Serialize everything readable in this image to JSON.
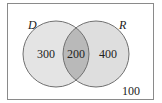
{
  "diagram": {
    "type": "venn",
    "universe_count": "100",
    "sets": [
      {
        "name": "D",
        "only_count": "300"
      },
      {
        "name": "R",
        "only_count": "400"
      }
    ],
    "intersection_count": "200",
    "colors": {
      "background": "#ffffff",
      "border": "#8a8a8a",
      "circle_fill": "#e2e2e2",
      "intersection_fill": "#b8b8b8",
      "circle_stroke": "#707070"
    }
  }
}
